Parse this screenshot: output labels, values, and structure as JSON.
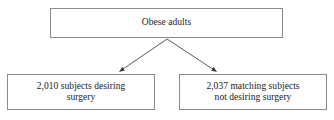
{
  "diagram": {
    "type": "flowchart",
    "title": "",
    "background_color": "#ffffff",
    "border_color": "#8a8a8a",
    "text_color": "#1a1a1a",
    "nodes": [
      {
        "id": "root",
        "label": "Obese adults",
        "shape": "rectangle"
      },
      {
        "id": "left",
        "label": "2,010 subjects desiring\nsurgery",
        "shape": "rectangle"
      },
      {
        "id": "right",
        "label": "2,037 matching subjects\nnot desiring surgery",
        "shape": "rectangle"
      }
    ],
    "edges": [
      {
        "from": "root",
        "to": "left",
        "label": "",
        "arrowhead": "filled-triangle"
      },
      {
        "from": "root",
        "to": "right",
        "label": "",
        "arrowhead": "filled-triangle"
      }
    ]
  }
}
